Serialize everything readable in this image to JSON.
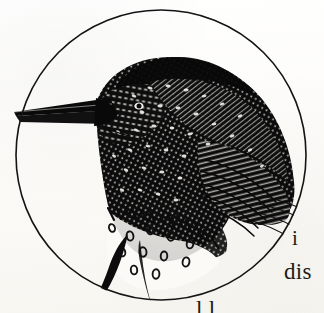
{
  "page": {
    "kind": "scanned-book-page-fragment",
    "background_color": "#fbfaf7",
    "ink_color": "#111111"
  },
  "illustration": {
    "title": "European Starling",
    "subject": "starling bird head and body, perched, facing left",
    "style": "wood-engraving / pen-and-ink cross-hatch vignette",
    "frame_shape": "circle",
    "frame": {
      "center_x": 161,
      "center_y": 155,
      "radius": 145,
      "stroke_width": 1.6,
      "stroke_color": "#141414"
    },
    "features": [
      "long pointed dark beak extending left beyond the circle rule",
      "densely hatched head and mantle flecked with pale speckles",
      "wing coverts rendered as rows of barred hatched feathers",
      "white lower breast scattered with dark teardrop spots",
      "dark tail/leg streak crossing the lower-left circle rule"
    ]
  },
  "text_fragments": [
    {
      "name": "fragment-i",
      "text": "i",
      "x": 292,
      "y": 228
    },
    {
      "name": "fragment-dis",
      "text": "dis",
      "x": 284,
      "y": 260
    },
    {
      "name": "fragment-bottom",
      "text": "l        l",
      "x": 196,
      "y": 298
    }
  ]
}
